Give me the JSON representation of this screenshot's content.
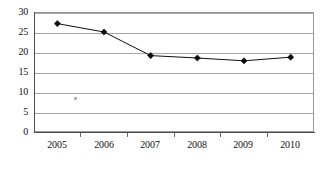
{
  "chart_data": {
    "type": "line",
    "title": "",
    "xlabel": "",
    "ylabel": "",
    "categories": [
      "2005",
      "2006",
      "2007",
      "2008",
      "2009",
      "2010"
    ],
    "values": [
      27.1,
      25.0,
      19.1,
      18.5,
      17.8,
      18.7
    ],
    "series": [
      {
        "name": "series-1",
        "values": [
          27.1,
          25.0,
          19.1,
          18.5,
          17.8,
          18.7
        ]
      }
    ],
    "ylim": [
      0,
      30
    ],
    "ytick_labels": [
      "0",
      "5",
      "10",
      "15",
      "20",
      "25",
      "30"
    ],
    "ytick_values": [
      0,
      5,
      10,
      15,
      20,
      25,
      30
    ],
    "xtick_labels": [
      "2005",
      "2006",
      "2007",
      "2008",
      "2009",
      "2010"
    ],
    "grid": true,
    "grid_axis": "y",
    "legend": false,
    "legend_position": "none",
    "marker": "diamond",
    "line_color": "#111111",
    "marker_color": "#0d0d0d",
    "gridline_color": "#a6a6a6",
    "plot_border_color": "#9a9a9a",
    "background_color": "#ffffff"
  },
  "figure": {
    "caption": "",
    "stray_mark_label": "scan-artifact"
  }
}
